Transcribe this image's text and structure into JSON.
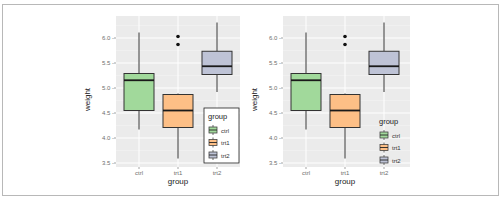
{
  "figure": {
    "panels": [
      {
        "id": "left",
        "legend_style": "boxed (with border, inside panel)"
      },
      {
        "id": "right",
        "legend_style": "no border, transparent background, inside panel"
      }
    ]
  },
  "chart_data": [
    {
      "type": "box",
      "title": "",
      "xlabel": "group",
      "ylabel": "weight",
      "categories": [
        "ctrl",
        "trt1",
        "trt2"
      ],
      "y_ticks": [
        "3.5",
        "4.0",
        "4.5",
        "5.0",
        "5.5",
        "6.0"
      ],
      "ylim": [
        3.5,
        6.35
      ],
      "grid": true,
      "legend": {
        "title": "group",
        "entries": [
          "ctrl",
          "trt1",
          "trt2"
        ],
        "position": "inside bottom-right",
        "border": true
      },
      "series": [
        {
          "name": "ctrl",
          "color": "#a1d99b",
          "min": 4.17,
          "q1": 4.55,
          "median": 5.155,
          "q3": 5.29,
          "max": 6.11,
          "outliers": []
        },
        {
          "name": "trt1",
          "color": "#fdbf86",
          "min": 3.59,
          "q1": 4.21,
          "median": 4.55,
          "q3": 4.87,
          "max": 4.89,
          "outliers": [
            5.87,
            6.03
          ]
        },
        {
          "name": "trt2",
          "color": "#bec3d6",
          "min": 4.92,
          "q1": 5.27,
          "median": 5.435,
          "q3": 5.735,
          "max": 6.31,
          "outliers": []
        }
      ]
    },
    {
      "type": "box",
      "title": "",
      "xlabel": "group",
      "ylabel": "weight",
      "categories": [
        "ctrl",
        "trt1",
        "trt2"
      ],
      "y_ticks": [
        "3.5",
        "4.0",
        "4.5",
        "5.0",
        "5.5",
        "6.0"
      ],
      "ylim": [
        3.5,
        6.35
      ],
      "grid": true,
      "legend": {
        "title": "group",
        "entries": [
          "ctrl",
          "trt1",
          "trt2"
        ],
        "position": "inside bottom-right",
        "border": false
      },
      "series": [
        {
          "name": "ctrl",
          "color": "#a1d99b",
          "min": 4.17,
          "q1": 4.55,
          "median": 5.155,
          "q3": 5.29,
          "max": 6.11,
          "outliers": []
        },
        {
          "name": "trt1",
          "color": "#fdbf86",
          "min": 3.59,
          "q1": 4.21,
          "median": 4.55,
          "q3": 4.87,
          "max": 4.89,
          "outliers": [
            5.87,
            6.03
          ]
        },
        {
          "name": "trt2",
          "color": "#bec3d6",
          "min": 4.92,
          "q1": 5.27,
          "median": 5.435,
          "q3": 5.735,
          "max": 6.31,
          "outliers": []
        }
      ]
    }
  ],
  "labels": {
    "xlabel": "group",
    "ylabel": "weight",
    "legend_title": "group",
    "cats": [
      "ctrl",
      "trt1",
      "trt2"
    ],
    "ticks": [
      "3.5 -",
      "4.0 -",
      "4.5 -",
      "5.0 -",
      "5.5 -",
      "6.0 -"
    ]
  }
}
